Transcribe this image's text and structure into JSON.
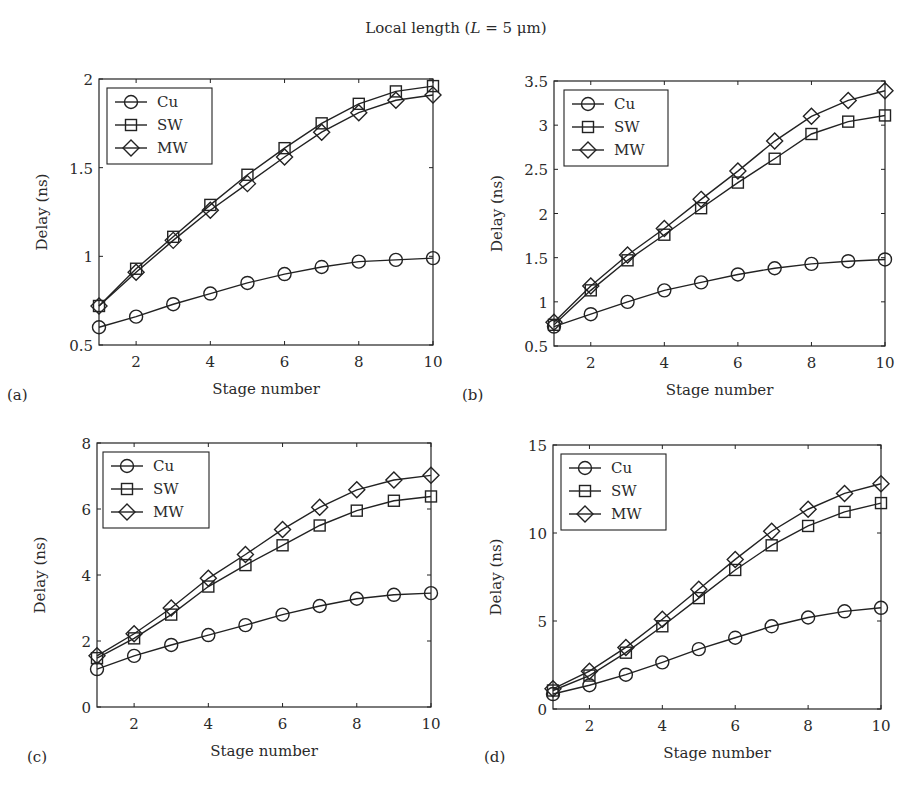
{
  "figure": {
    "title": "Local length (L = 5 μm)",
    "title_parts": {
      "prefix": "Local length (",
      "var": "L",
      "rest": " = 5 μm)"
    },
    "line_color": "#222222",
    "background": "#ffffff"
  },
  "chart_data": [
    {
      "type": "line",
      "panel": "(a)",
      "title": "",
      "xlabel": "Stage number",
      "ylabel": "Delay (ns)",
      "x": [
        1,
        2,
        3,
        4,
        5,
        6,
        7,
        8,
        9,
        10
      ],
      "xlim": [
        1,
        10
      ],
      "ylim": [
        0.5,
        2
      ],
      "xticks": [
        2,
        4,
        6,
        8,
        10
      ],
      "yticks": [
        0.5,
        1,
        1.5,
        2
      ],
      "ytick_labels": [
        "0.5",
        "1",
        "1.5",
        "2"
      ],
      "grid": false,
      "legend_position": "top-left",
      "series": [
        {
          "name": "Cu",
          "marker": "circle",
          "values": [
            0.6,
            0.66,
            0.73,
            0.79,
            0.85,
            0.9,
            0.94,
            0.97,
            0.98,
            0.99
          ]
        },
        {
          "name": "SW",
          "marker": "square",
          "values": [
            0.72,
            0.93,
            1.11,
            1.29,
            1.46,
            1.61,
            1.75,
            1.86,
            1.93,
            1.96
          ]
        },
        {
          "name": "MW",
          "marker": "diamond",
          "values": [
            0.72,
            0.91,
            1.09,
            1.26,
            1.41,
            1.56,
            1.7,
            1.81,
            1.88,
            1.91
          ]
        }
      ]
    },
    {
      "type": "line",
      "panel": "(b)",
      "title": "",
      "xlabel": "Stage number",
      "ylabel": "Delay (ns)",
      "x": [
        1,
        2,
        3,
        4,
        5,
        6,
        7,
        8,
        9,
        10
      ],
      "xlim": [
        1,
        10
      ],
      "ylim": [
        0.5,
        3.5
      ],
      "xticks": [
        2,
        4,
        6,
        8,
        10
      ],
      "yticks": [
        0.5,
        1,
        1.5,
        2,
        2.5,
        3,
        3.5
      ],
      "ytick_labels": [
        "0.5",
        "1",
        "1.5",
        "2",
        "2.5",
        "3",
        "3.5"
      ],
      "grid": false,
      "legend_position": "top-left",
      "series": [
        {
          "name": "Cu",
          "marker": "circle",
          "values": [
            0.72,
            0.86,
            1.0,
            1.13,
            1.22,
            1.31,
            1.38,
            1.43,
            1.46,
            1.48
          ]
        },
        {
          "name": "SW",
          "marker": "square",
          "values": [
            0.74,
            1.13,
            1.47,
            1.76,
            2.06,
            2.35,
            2.62,
            2.9,
            3.04,
            3.11
          ]
        },
        {
          "name": "MW",
          "marker": "diamond",
          "values": [
            0.77,
            1.18,
            1.53,
            1.83,
            2.16,
            2.48,
            2.82,
            3.1,
            3.28,
            3.39
          ]
        }
      ]
    },
    {
      "type": "line",
      "panel": "(c)",
      "title": "",
      "xlabel": "Stage number",
      "ylabel": "Delay (ns)",
      "x": [
        1,
        2,
        3,
        4,
        5,
        6,
        7,
        8,
        9,
        10
      ],
      "xlim": [
        1,
        10
      ],
      "ylim": [
        0,
        8
      ],
      "xticks": [
        2,
        4,
        6,
        8,
        10
      ],
      "yticks": [
        0,
        2,
        4,
        6,
        8
      ],
      "ytick_labels": [
        "0",
        "2",
        "4",
        "6",
        "8"
      ],
      "grid": false,
      "legend_position": "top-left",
      "series": [
        {
          "name": "Cu",
          "marker": "circle",
          "values": [
            1.15,
            1.55,
            1.88,
            2.18,
            2.48,
            2.8,
            3.06,
            3.28,
            3.4,
            3.45
          ]
        },
        {
          "name": "SW",
          "marker": "square",
          "values": [
            1.48,
            2.08,
            2.8,
            3.65,
            4.3,
            4.9,
            5.5,
            5.95,
            6.25,
            6.38
          ]
        },
        {
          "name": "MW",
          "marker": "diamond",
          "values": [
            1.55,
            2.22,
            3.0,
            3.9,
            4.62,
            5.38,
            6.05,
            6.58,
            6.88,
            7.02
          ]
        }
      ]
    },
    {
      "type": "line",
      "panel": "(d)",
      "title": "",
      "xlabel": "Stage number",
      "ylabel": "Delay (ns)",
      "x": [
        1,
        2,
        3,
        4,
        5,
        6,
        7,
        8,
        9,
        10
      ],
      "xlim": [
        1,
        10
      ],
      "ylim": [
        0,
        15
      ],
      "xticks": [
        2,
        4,
        6,
        8,
        10
      ],
      "yticks": [
        0,
        5,
        10,
        15
      ],
      "ytick_labels": [
        "0",
        "5",
        "10",
        "15"
      ],
      "grid": false,
      "legend_position": "top-left",
      "series": [
        {
          "name": "Cu",
          "marker": "circle",
          "values": [
            0.85,
            1.35,
            1.95,
            2.65,
            3.4,
            4.05,
            4.7,
            5.2,
            5.55,
            5.75
          ]
        },
        {
          "name": "SW",
          "marker": "square",
          "values": [
            1.05,
            1.9,
            3.2,
            4.7,
            6.3,
            7.9,
            9.3,
            10.4,
            11.2,
            11.7
          ]
        },
        {
          "name": "MW",
          "marker": "diamond",
          "values": [
            1.15,
            2.15,
            3.5,
            5.1,
            6.8,
            8.5,
            10.1,
            11.35,
            12.25,
            12.8
          ]
        }
      ]
    }
  ]
}
